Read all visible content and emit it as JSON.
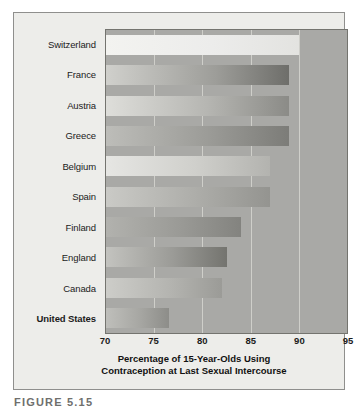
{
  "chart_data": {
    "type": "bar",
    "orientation": "horizontal",
    "title": "",
    "xlabel": "Percentage of 15-Year-Olds Using Contraception at Last Sexual Intercourse",
    "ylabel": "",
    "xlim": [
      70,
      95
    ],
    "xticks": [
      70,
      75,
      80,
      85,
      90,
      95
    ],
    "grid": true,
    "legend": "none",
    "categories": [
      "Switzerland",
      "France",
      "Austria",
      "Greece",
      "Belgium",
      "Spain",
      "Finland",
      "England",
      "Canada",
      "United States"
    ],
    "values": [
      90,
      89,
      89,
      89,
      87,
      87,
      84,
      82.5,
      82,
      76.5
    ],
    "highlight_category": "United States"
  },
  "axis_title": {
    "line1": "Percentage of 15-Year-Olds Using",
    "line2": "Contraception at Last Sexual Intercourse"
  },
  "caption": {
    "text": "FIGURE 5.15"
  }
}
